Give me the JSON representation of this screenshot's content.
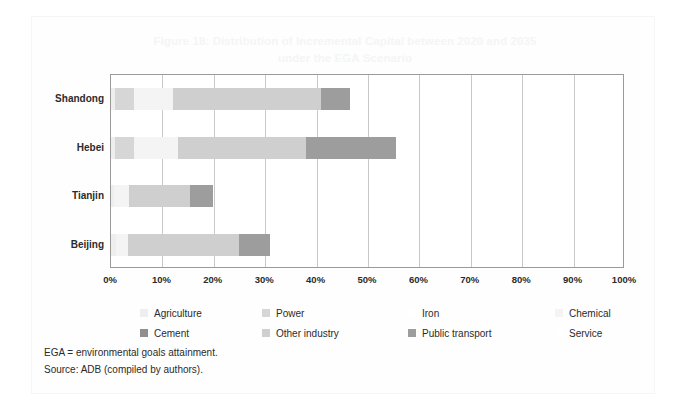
{
  "figure": {
    "title_line1": "Figure 18: Distribution of Incremental Capital between 2020 and 2035",
    "title_line2": "under the EGA Scenario",
    "title_color": "#f4f5f6"
  },
  "notes": {
    "abbreviation": "EGA = environmental goals attainment.",
    "source": "Source: ADB (compiled by authors)."
  },
  "legend": {
    "row1": [
      {
        "label": "Agriculture",
        "color": "#eeeeee"
      },
      {
        "label": "Power",
        "color": "#d6d6d6"
      },
      {
        "label": "Iron",
        "color": "#ffffff"
      },
      {
        "label": "Chemical",
        "color": "#f4f4f4"
      }
    ],
    "row2": [
      {
        "label": "Cement",
        "color": "#8f8f8f"
      },
      {
        "label": "Other industry",
        "color": "#cfcfcf"
      },
      {
        "label": "Public transport",
        "color": "#9d9d9d"
      },
      {
        "label": "Service",
        "color": "#ffffff"
      }
    ]
  },
  "chart_data": {
    "type": "bar",
    "orientation": "horizontal",
    "stacked": true,
    "title": "Figure 18: Distribution of Incremental Capital between 2020 and 2035 under the EGA Scenario",
    "xlabel": "",
    "ylabel": "",
    "xlim": [
      0,
      100
    ],
    "xticks": [
      0,
      10,
      20,
      30,
      40,
      50,
      60,
      70,
      80,
      90,
      100
    ],
    "xtick_labels": [
      "0%",
      "10%",
      "20%",
      "30%",
      "40%",
      "50%",
      "60%",
      "70%",
      "80%",
      "90%",
      "100%"
    ],
    "grid": true,
    "legend_position": "bottom",
    "categories": [
      "Shandong",
      "Hebei",
      "Tianjin",
      "Beijing"
    ],
    "series": [
      {
        "name": "Agriculture",
        "color": "#eeeeee",
        "values": [
          0.8,
          0.8,
          0.6,
          0.9
        ]
      },
      {
        "name": "Power",
        "color": "#d6d6d6",
        "values": [
          3.6,
          3.7,
          0.0,
          0.0
        ]
      },
      {
        "name": "Iron",
        "color": "#ffffff",
        "values": [
          0.0,
          0.0,
          0.0,
          0.0
        ]
      },
      {
        "name": "Chemical",
        "color": "#f4f4f4",
        "values": [
          7.6,
          8.5,
          2.9,
          2.4
        ]
      },
      {
        "name": "Cement",
        "color": "#8f8f8f",
        "values": [
          0.0,
          0.0,
          0.0,
          0.0
        ]
      },
      {
        "name": "Other industry",
        "color": "#cfcfcf",
        "values": [
          28.9,
          25.0,
          11.9,
          21.6
        ]
      },
      {
        "name": "Public transport",
        "color": "#9d9d9d",
        "values": [
          5.6,
          17.5,
          4.5,
          6.0
        ]
      },
      {
        "name": "Service",
        "color": "#ffffff",
        "values": [
          0.0,
          0.0,
          0.0,
          0.0
        ]
      }
    ],
    "totals": [
      46.5,
      55.5,
      19.9,
      30.9
    ]
  },
  "axis": {
    "y_categories": [
      "Shandong",
      "Hebei",
      "Tianjin",
      "Beijing"
    ]
  }
}
